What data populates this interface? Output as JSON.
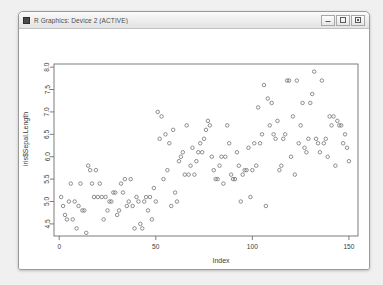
{
  "window": {
    "title": "R Graphics: Device 2 (ACTIVE)",
    "app_icon": "r-graphics-icon",
    "buttons": {
      "minimize": "minimize-icon",
      "maximize": "maximize-icon",
      "close": "close-icon"
    }
  },
  "colors": {
    "point_stroke": "#737373",
    "axis": "#6e6e6e",
    "text": "#3c3c3c",
    "plot_background": "#ffffff",
    "window_background": "#ffffff",
    "desktop_background": "#f0f0f0"
  },
  "chart_data": {
    "type": "scatter",
    "title": "",
    "xlabel": "Index",
    "ylabel": "iris$Sepal.Length",
    "xlim": [
      -2.7,
      154.7
    ],
    "ylim": [
      4.23,
      8.07
    ],
    "xticks": [
      0,
      50,
      100,
      150
    ],
    "yticks": [
      4.5,
      5.0,
      5.5,
      6.0,
      6.5,
      7.0,
      7.5,
      8.0
    ],
    "xtick_labels": [
      "0",
      "50",
      "100",
      "150"
    ],
    "ytick_labels": [
      "4.5",
      "5.0",
      "5.5",
      "6.0",
      "6.5",
      "7.0",
      "7.5",
      "8.0"
    ],
    "grid": false,
    "legend": false,
    "point_symbol": "open-circle",
    "point_count": 150,
    "series": [
      {
        "name": "iris$Sepal.Length",
        "x": [
          1,
          2,
          3,
          4,
          5,
          6,
          7,
          8,
          9,
          10,
          11,
          12,
          13,
          14,
          15,
          16,
          17,
          18,
          19,
          20,
          21,
          22,
          23,
          24,
          25,
          26,
          27,
          28,
          29,
          30,
          31,
          32,
          33,
          34,
          35,
          36,
          37,
          38,
          39,
          40,
          41,
          42,
          43,
          44,
          45,
          46,
          47,
          48,
          49,
          50,
          51,
          52,
          53,
          54,
          55,
          56,
          57,
          58,
          59,
          60,
          61,
          62,
          63,
          64,
          65,
          66,
          67,
          68,
          69,
          70,
          71,
          72,
          73,
          74,
          75,
          76,
          77,
          78,
          79,
          80,
          81,
          82,
          83,
          84,
          85,
          86,
          87,
          88,
          89,
          90,
          91,
          92,
          93,
          94,
          95,
          96,
          97,
          98,
          99,
          100,
          101,
          102,
          103,
          104,
          105,
          106,
          107,
          108,
          109,
          110,
          111,
          112,
          113,
          114,
          115,
          116,
          117,
          118,
          119,
          120,
          121,
          122,
          123,
          124,
          125,
          126,
          127,
          128,
          129,
          130,
          131,
          132,
          133,
          134,
          135,
          136,
          137,
          138,
          139,
          140,
          141,
          142,
          143,
          144,
          145,
          146,
          147,
          148,
          149,
          150
        ],
        "y": [
          5.1,
          4.9,
          4.7,
          4.6,
          5.0,
          5.4,
          4.6,
          5.0,
          4.4,
          4.9,
          5.4,
          4.8,
          4.8,
          4.3,
          5.8,
          5.7,
          5.4,
          5.1,
          5.7,
          5.1,
          5.4,
          5.1,
          4.6,
          5.1,
          4.8,
          5.0,
          5.0,
          5.2,
          5.2,
          4.7,
          4.8,
          5.4,
          5.2,
          5.5,
          4.9,
          5.0,
          5.5,
          4.9,
          4.4,
          5.1,
          5.0,
          4.5,
          4.4,
          5.0,
          5.1,
          4.8,
          5.1,
          4.6,
          5.3,
          5.0,
          7.0,
          6.4,
          6.9,
          5.5,
          6.5,
          5.7,
          6.3,
          4.9,
          6.6,
          5.2,
          5.0,
          5.9,
          6.0,
          6.1,
          5.6,
          6.7,
          5.6,
          5.8,
          6.2,
          5.6,
          5.9,
          6.1,
          6.3,
          6.1,
          6.4,
          6.6,
          6.8,
          6.7,
          6.0,
          5.7,
          5.5,
          5.5,
          5.8,
          6.0,
          5.4,
          6.0,
          6.7,
          6.3,
          5.6,
          5.5,
          5.5,
          6.1,
          5.8,
          5.0,
          5.6,
          5.7,
          5.7,
          6.2,
          5.1,
          5.7,
          6.3,
          5.8,
          7.1,
          6.3,
          6.5,
          7.6,
          4.9,
          7.3,
          6.7,
          7.2,
          6.5,
          6.4,
          6.8,
          5.7,
          5.8,
          6.4,
          6.5,
          7.7,
          7.7,
          6.0,
          6.9,
          5.6,
          7.7,
          6.3,
          6.7,
          7.2,
          6.2,
          6.1,
          6.4,
          7.2,
          7.4,
          7.9,
          6.4,
          6.3,
          6.1,
          7.7,
          6.3,
          6.4,
          6.0,
          6.9,
          6.7,
          6.9,
          5.8,
          6.8,
          6.7,
          6.7,
          6.3,
          6.5,
          6.2,
          5.9
        ]
      }
    ]
  }
}
